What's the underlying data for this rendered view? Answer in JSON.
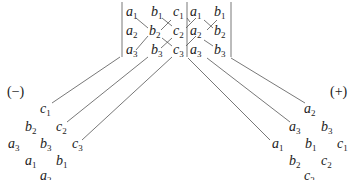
{
  "diagram": {
    "matrix": {
      "rows": [
        [
          {
            "v": "a",
            "s": "1"
          },
          {
            "v": "b",
            "s": "1"
          },
          {
            "v": "c",
            "s": "1"
          },
          {
            "v": "a",
            "s": "1"
          },
          {
            "v": "b",
            "s": "1"
          }
        ],
        [
          {
            "v": "a",
            "s": "2"
          },
          {
            "v": "b",
            "s": "2"
          },
          {
            "v": "c",
            "s": "2"
          },
          {
            "v": "a",
            "s": "2"
          },
          {
            "v": "b",
            "s": "2"
          }
        ],
        [
          {
            "v": "a",
            "s": "3"
          },
          {
            "v": "b",
            "s": "3"
          },
          {
            "v": "c",
            "s": "3"
          },
          {
            "v": "a",
            "s": "3"
          },
          {
            "v": "b",
            "s": "3"
          }
        ]
      ]
    },
    "minus": {
      "label": "(−)",
      "terms": [
        {
          "v": "c",
          "s": "1"
        },
        {
          "v": "b",
          "s": "2"
        },
        {
          "v": "c",
          "s": "2"
        },
        {
          "v": "a",
          "s": "3"
        },
        {
          "v": "b",
          "s": "3"
        },
        {
          "v": "c",
          "s": "3"
        },
        {
          "v": "a",
          "s": "1"
        },
        {
          "v": "b",
          "s": "1"
        },
        {
          "v": "a",
          "s": "2"
        }
      ]
    },
    "plus": {
      "label": "(+)",
      "terms": [
        {
          "v": "a",
          "s": "2"
        },
        {
          "v": "a",
          "s": "3"
        },
        {
          "v": "b",
          "s": "3"
        },
        {
          "v": "a",
          "s": "1"
        },
        {
          "v": "b",
          "s": "1"
        },
        {
          "v": "c",
          "s": "1"
        },
        {
          "v": "b",
          "s": "2"
        },
        {
          "v": "c",
          "s": "2"
        },
        {
          "v": "c",
          "s": "3"
        }
      ]
    },
    "line_color": "#555555"
  }
}
